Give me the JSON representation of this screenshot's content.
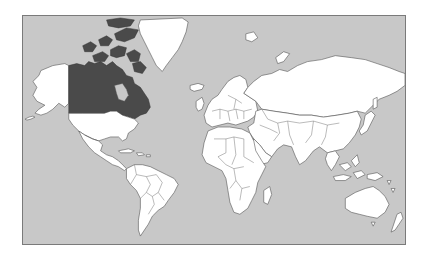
{
  "map": {
    "projection": "mercator",
    "type": "world political outline",
    "colors": {
      "ocean": "#c8c8c8",
      "land": "#ffffff",
      "highlight": "#4a4a4a",
      "border": "#555555",
      "frame": "#7a7a7a"
    },
    "highlighted_regions": [
      {
        "name": "Canada",
        "color": "#4a4a4a"
      }
    ],
    "regions": [
      {
        "name": "Alaska (USA)"
      },
      {
        "name": "Canada"
      },
      {
        "name": "United States"
      },
      {
        "name": "Greenland"
      },
      {
        "name": "Iceland"
      },
      {
        "name": "Mexico"
      },
      {
        "name": "Central America"
      },
      {
        "name": "Caribbean"
      },
      {
        "name": "South America"
      },
      {
        "name": "Europe"
      },
      {
        "name": "Africa"
      },
      {
        "name": "Madagascar"
      },
      {
        "name": "Middle East"
      },
      {
        "name": "Russia"
      },
      {
        "name": "Central Asia"
      },
      {
        "name": "South Asia"
      },
      {
        "name": "China"
      },
      {
        "name": "Japan"
      },
      {
        "name": "Southeast Asia"
      },
      {
        "name": "Australia"
      },
      {
        "name": "New Zealand"
      }
    ]
  }
}
